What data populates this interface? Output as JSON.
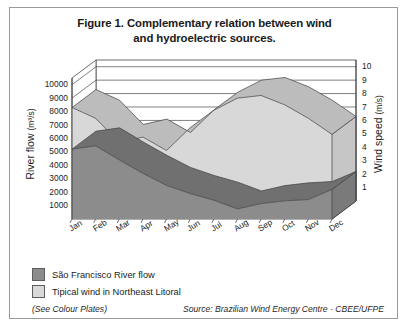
{
  "figure": {
    "title_line1": "Figure 1. Complementary relation between wind",
    "title_line2": "and hydroelectric sources."
  },
  "legend": {
    "items": [
      {
        "label": "São Francisco River flow",
        "color": "#8c8c8c",
        "name": "river-flow"
      },
      {
        "label": "Tipical wind in Northeast Litoral",
        "color": "#d8d8d8",
        "name": "wind"
      }
    ]
  },
  "footer": {
    "note": "(See Colour Plates)",
    "source": "Source: Brazilian Wind Energy Centre - CBEE/UFPE"
  },
  "chart_data": {
    "type": "area",
    "title": "Figure 1. Complementary relation between wind and hydroelectric sources.",
    "subtitle": "",
    "is_3d": true,
    "grid": true,
    "legend_position": "below",
    "categories": [
      "Jan",
      "Feb",
      "Mar",
      "Apr",
      "May",
      "Jun",
      "Jul",
      "Aug",
      "Sep",
      "Oct",
      "Nov",
      "Dec"
    ],
    "xlabel": "",
    "ylabel": "River flow",
    "yunit": "(m³/s)",
    "ylim": [
      0,
      10500
    ],
    "yticks": [
      1000,
      2000,
      3000,
      4000,
      5000,
      6000,
      7000,
      8000,
      9000,
      10000
    ],
    "y2label": "Wind speed",
    "y2unit": "(m/s)",
    "y2lim": [
      0,
      10.5
    ],
    "y2ticks": [
      1,
      2,
      3,
      4,
      5,
      6,
      7,
      8,
      9,
      10
    ],
    "series": [
      {
        "name": "Tipical wind in Northeast Litoral",
        "axis": "right",
        "unit": "m/s",
        "color": "#d8d8d8",
        "values": [
          8.3,
          7.5,
          5.7,
          6.1,
          5.1,
          6.8,
          8.1,
          9.0,
          9.2,
          8.5,
          7.5,
          6.3
        ]
      },
      {
        "name": "São Francisco River flow",
        "axis": "left",
        "unit": "m³/s",
        "color": "#8c8c8c",
        "values": [
          5200,
          5450,
          4400,
          3400,
          2500,
          1900,
          1400,
          750,
          1150,
          1350,
          1450,
          2200
        ]
      }
    ]
  }
}
